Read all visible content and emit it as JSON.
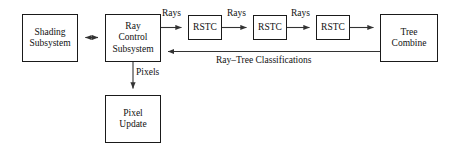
{
  "diagram": {
    "background_color": "#ffffff",
    "line_color": "#333333",
    "border_color": "#1a1a1a",
    "text_color": "#111111",
    "nodes": [
      {
        "id": "shading",
        "line1": "Shading",
        "line2": "Subsystem"
      },
      {
        "id": "raycontrol",
        "line1": "Ray",
        "line2": "Control",
        "line3": "Subsystem"
      },
      {
        "id": "rstc1",
        "line1": "RSTC"
      },
      {
        "id": "rstc2",
        "line1": "RSTC"
      },
      {
        "id": "rstc3",
        "line1": "RSTC"
      },
      {
        "id": "treecombine",
        "line1": "Tree",
        "line2": "Combine"
      },
      {
        "id": "pixelupdate",
        "line1": "Pixel",
        "line2": "Update"
      }
    ],
    "edge_labels": {
      "rays_1": "Rays",
      "rays_2": "Rays",
      "rays_3": "Rays",
      "pixels": "Pixels",
      "ray_tree_classifications": "Ray–Tree Classifications"
    }
  }
}
